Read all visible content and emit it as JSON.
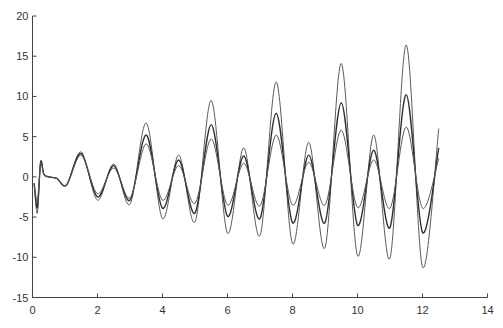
{
  "chart_data": {
    "type": "line",
    "title": "",
    "xlabel": "",
    "ylabel": "",
    "xlim": [
      0,
      14
    ],
    "ylim": [
      -15,
      20
    ],
    "xticks": [
      0,
      2,
      4,
      6,
      8,
      10,
      12,
      14
    ],
    "yticks": [
      -15,
      -10,
      -5,
      0,
      5,
      10,
      15,
      20
    ],
    "xtick_labels": [
      "0",
      "2",
      "4",
      "6",
      "8",
      "10",
      "12",
      "14"
    ],
    "ytick_labels": [
      "-15",
      "-10",
      "-5",
      "0",
      "5",
      "10",
      "15",
      "20"
    ],
    "grid": false,
    "legend": null,
    "x": [
      0.05,
      0.15,
      0.25,
      0.35,
      0.5,
      0.75,
      1.05,
      1.5,
      2.0,
      2.5,
      3.0,
      3.5,
      4.0,
      4.5,
      5.0,
      5.5,
      6.0,
      6.5,
      7.0,
      7.5,
      8.0,
      8.5,
      9.0,
      9.5,
      10.0,
      10.5,
      11.0,
      11.5,
      12.0,
      12.5
    ],
    "series": [
      {
        "name": "upper bound",
        "color": "#5a5a5a",
        "values": [
          -0.8,
          -4.5,
          1.9,
          0.3,
          0.0,
          -0.2,
          -1.0,
          3.1,
          -2.9,
          1.6,
          -3.4,
          6.7,
          -5.2,
          2.7,
          -5.6,
          9.5,
          -7.0,
          3.6,
          -7.3,
          11.8,
          -8.3,
          4.3,
          -8.8,
          14.1,
          -9.8,
          5.2,
          -10.1,
          16.4,
          -11.2,
          6.0
        ]
      },
      {
        "name": "mean",
        "color": "#2e2e2e",
        "values": [
          -0.8,
          -3.8,
          1.8,
          0.3,
          0.0,
          -0.2,
          -1.0,
          2.9,
          -2.5,
          1.4,
          -2.9,
          5.2,
          -3.9,
          2.1,
          -4.5,
          6.5,
          -4.9,
          2.6,
          -5.2,
          7.9,
          -5.7,
          2.7,
          -5.7,
          9.2,
          -6.0,
          3.3,
          -6.3,
          10.2,
          -6.9,
          3.6
        ]
      },
      {
        "name": "lower bound",
        "color": "#5a5a5a",
        "values": [
          -0.8,
          -3.0,
          1.7,
          0.3,
          0.0,
          -0.2,
          -1.0,
          2.7,
          -2.1,
          1.1,
          -2.6,
          4.1,
          -2.9,
          1.4,
          -3.3,
          4.7,
          -3.5,
          1.7,
          -3.6,
          5.2,
          -3.5,
          1.8,
          -3.5,
          5.8,
          -3.8,
          2.1,
          -3.9,
          6.2,
          -3.9,
          2.3
        ]
      }
    ]
  }
}
